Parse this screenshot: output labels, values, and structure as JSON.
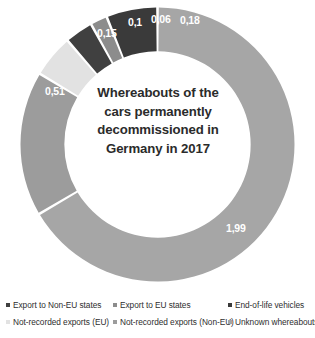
{
  "chart_data": {
    "type": "pie",
    "variant": "donut",
    "title": "Whereabouts of the cars permanently decommissioned in Germany in 2017",
    "title_lines": [
      "Whereabouts of the",
      "cars permanently",
      "decommissioned in",
      "Germany in 2017"
    ],
    "unit_note": "",
    "total": 2.99,
    "decimal_separator": ",",
    "start_angle_deg": 0,
    "direction": "clockwise",
    "inner_radius_ratio": 0.68,
    "legend_position": "bottom",
    "grid": false,
    "categories": [
      "Unknown whereabouts",
      "Not-recorded exports (Non-EU)",
      "Not-recorded exports (EU)",
      "Export to Non-EU states",
      "Export to EU states",
      "End-of-life vehicles"
    ],
    "values": [
      1.99,
      0.51,
      0.15,
      0.1,
      0.06,
      0.18
    ],
    "labels": [
      "1,99",
      "0,51",
      "0,15",
      "0,1",
      "0,06",
      "0,18"
    ],
    "colors": [
      "#a6a6a6",
      "#9c9c9c",
      "#e2e2e2",
      "#404040",
      "#8c8c8c",
      "#3a3a3a"
    ],
    "slices": [
      {
        "name": "Unknown whereabouts",
        "value": 1.99,
        "label": "1,99",
        "color": "#a6a6a6",
        "angle_deg": 239.6,
        "label_x": 226,
        "label_y": 222
      },
      {
        "name": "Not-recorded exports (Non-EU)",
        "value": 0.51,
        "label": "0,51",
        "color": "#9c9c9c",
        "angle_deg": 61.4,
        "label_x": 45,
        "label_y": 85
      },
      {
        "name": "Not-recorded exports (EU)",
        "value": 0.15,
        "label": "0,15",
        "color": "#e2e2e2",
        "angle_deg": 18.1,
        "label_x": 97,
        "label_y": 27
      },
      {
        "name": "Export to Non-EU states",
        "value": 0.1,
        "label": "0,1",
        "color": "#404040",
        "angle_deg": 12.0,
        "label_x": 128,
        "label_y": 16
      },
      {
        "name": "Export to EU states",
        "value": 0.06,
        "label": "0,06",
        "color": "#8c8c8c",
        "angle_deg": 7.2,
        "label_x": 151,
        "label_y": 13
      },
      {
        "name": "End-of-life vehicles",
        "value": 0.18,
        "label": "0,18",
        "color": "#3a3a3a",
        "angle_deg": 21.7,
        "label_x": 180,
        "label_y": 14
      }
    ]
  },
  "legend": {
    "rows": [
      [
        {
          "label": "Export to Non-EU states",
          "color": "#404040",
          "left": 6
        },
        {
          "label": "Export to EU states",
          "color": "#8c8c8c",
          "left": 113
        },
        {
          "label": "End-of-life vehicles",
          "color": "#3a3a3a",
          "left": 228
        }
      ],
      [
        {
          "label": "Not-recorded exports (EU)",
          "color": "#e2e2e2",
          "left": 6
        },
        {
          "label": "Not-recorded exports (Non-EU)",
          "color": "#9c9c9c",
          "left": 113
        },
        {
          "label": "Unknown whereabouts",
          "color": "#a6a6a6",
          "left": 228
        }
      ]
    ]
  }
}
